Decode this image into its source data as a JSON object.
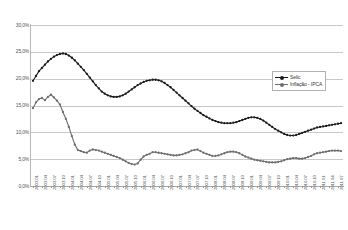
{
  "chart_data": {
    "type": "line",
    "title": "",
    "xlabel": "",
    "ylabel": "",
    "ylim": [
      0,
      30
    ],
    "yticks": [
      "0,0%",
      "5,0%",
      "10,0%",
      "15,0%",
      "20,0%",
      "25,0%",
      "30,0%"
    ],
    "ytick_values": [
      0,
      5,
      10,
      15,
      20,
      25,
      30
    ],
    "grid": true,
    "legend_position": "top-right",
    "legend": [
      "Selic",
      "Inflação - IPCA"
    ],
    "colors": {
      "selic": "#1a1a1a",
      "ipca": "#6e6e6e"
    },
    "x": [
      "2003.01",
      "2003.02",
      "2003.03",
      "2003.04",
      "2003.05",
      "2003.06",
      "2003.07",
      "2003.08",
      "2003.09",
      "2003.10",
      "2003.11",
      "2003.12",
      "2004.01",
      "2004.02",
      "2004.03",
      "2004.04",
      "2004.05",
      "2004.06",
      "2004.07",
      "2004.08",
      "2004.09",
      "2004.10",
      "2004.11",
      "2004.12",
      "2005.01",
      "2005.02",
      "2005.03",
      "2005.04",
      "2005.05",
      "2005.06",
      "2005.07",
      "2005.08",
      "2005.09",
      "2005.10",
      "2005.11",
      "2005.12",
      "2006.01",
      "2006.02",
      "2006.03",
      "2006.04",
      "2006.05",
      "2006.06",
      "2006.07",
      "2006.08",
      "2006.09",
      "2006.10",
      "2006.11",
      "2006.12",
      "2007.01",
      "2007.02",
      "2007.03",
      "2007.04",
      "2007.05",
      "2007.06",
      "2007.07",
      "2007.08",
      "2007.09",
      "2007.10",
      "2007.11",
      "2007.12",
      "2008.01",
      "2008.02",
      "2008.03",
      "2008.04",
      "2008.05",
      "2008.06",
      "2008.07",
      "2008.08",
      "2008.09",
      "2008.10",
      "2008.11",
      "2008.12",
      "2009.01",
      "2009.02",
      "2009.03",
      "2009.04",
      "2009.05",
      "2009.06",
      "2009.07",
      "2009.08",
      "2009.09",
      "2009.10",
      "2009.11",
      "2009.12",
      "2010.01",
      "2010.02",
      "2010.03",
      "2010.04",
      "2010.05",
      "2010.06",
      "2010.07",
      "2010.08",
      "2010.09",
      "2010.10",
      "2010.11",
      "2010.12",
      "2011.01",
      "2011.02",
      "2011.03",
      "2011.04",
      "2011.05",
      "2011.06",
      "2011.07",
      "2011.08"
    ],
    "xtick_labels": [
      "2003.01",
      "2003.04",
      "2003.07",
      "2003.10",
      "2004.01",
      "2004.04",
      "2004.07",
      "2004.10",
      "2005.01",
      "2005.04",
      "2005.07",
      "2005.10",
      "2006.01",
      "2006.04",
      "2006.07",
      "2006.10",
      "2007.01",
      "2007.04",
      "2007.07",
      "2007.10",
      "2008.01",
      "2008.04",
      "2008.07",
      "2008.10",
      "2009.01",
      "2009.04",
      "2009.07",
      "2009.10",
      "2010.01",
      "2010.04",
      "2010.07",
      "2010.10",
      "2011.01",
      "2011.04",
      "2011.07"
    ],
    "series": [
      {
        "name": "Selic",
        "color": "#1a1a1a",
        "values": [
          19.6,
          20.5,
          21.4,
          22.0,
          22.6,
          23.2,
          23.7,
          24.1,
          24.4,
          24.6,
          24.7,
          24.6,
          24.3,
          23.9,
          23.4,
          22.8,
          22.2,
          21.6,
          20.9,
          20.2,
          19.5,
          18.8,
          18.2,
          17.6,
          17.2,
          16.9,
          16.7,
          16.6,
          16.6,
          16.7,
          16.9,
          17.2,
          17.6,
          18.0,
          18.4,
          18.8,
          19.1,
          19.4,
          19.6,
          19.7,
          19.8,
          19.8,
          19.7,
          19.5,
          19.2,
          18.8,
          18.4,
          17.9,
          17.4,
          16.9,
          16.4,
          15.9,
          15.4,
          14.9,
          14.4,
          14.0,
          13.6,
          13.2,
          12.9,
          12.6,
          12.3,
          12.1,
          11.9,
          11.8,
          11.7,
          11.7,
          11.7,
          11.8,
          11.9,
          12.1,
          12.3,
          12.5,
          12.7,
          12.8,
          12.8,
          12.7,
          12.5,
          12.2,
          11.8,
          11.4,
          11.0,
          10.6,
          10.3,
          10.0,
          9.7,
          9.5,
          9.4,
          9.4,
          9.5,
          9.7,
          9.9,
          10.1,
          10.3,
          10.5,
          10.7,
          10.9,
          11.0,
          11.1,
          11.2,
          11.3,
          11.4,
          11.5,
          11.6,
          11.7
        ]
      },
      {
        "name": "Inflação - IPCA",
        "color": "#6e6e6e",
        "values": [
          14.5,
          15.6,
          16.2,
          16.4,
          16.0,
          16.6,
          17.0,
          16.5,
          15.9,
          15.2,
          13.8,
          12.5,
          11.0,
          9.3,
          7.7,
          6.7,
          6.5,
          6.3,
          6.2,
          6.6,
          6.8,
          6.7,
          6.6,
          6.4,
          6.2,
          6.0,
          5.8,
          5.6,
          5.4,
          5.2,
          4.9,
          4.6,
          4.3,
          4.1,
          4.0,
          4.2,
          4.9,
          5.5,
          5.8,
          6.0,
          6.3,
          6.3,
          6.2,
          6.1,
          6.0,
          5.9,
          5.8,
          5.7,
          5.7,
          5.8,
          5.9,
          6.1,
          6.3,
          6.6,
          6.7,
          6.8,
          6.5,
          6.2,
          6.0,
          5.8,
          5.6,
          5.6,
          5.7,
          5.9,
          6.1,
          6.3,
          6.4,
          6.4,
          6.3,
          6.1,
          5.8,
          5.5,
          5.3,
          5.1,
          4.9,
          4.8,
          4.7,
          4.6,
          4.5,
          4.4,
          4.4,
          4.4,
          4.5,
          4.6,
          4.8,
          5.0,
          5.1,
          5.2,
          5.2,
          5.1,
          5.1,
          5.2,
          5.4,
          5.6,
          5.9,
          6.1,
          6.2,
          6.3,
          6.4,
          6.5,
          6.6,
          6.6,
          6.6,
          6.5
        ]
      }
    ]
  }
}
